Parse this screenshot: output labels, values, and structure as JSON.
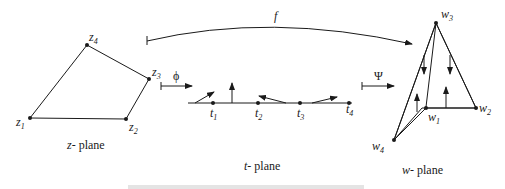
{
  "diagram": {
    "type": "conformal-mapping",
    "planes": {
      "z": {
        "label_var": "z",
        "label_suffix": "- plane",
        "vertices": [
          {
            "name": "z",
            "index": "1"
          },
          {
            "name": "z",
            "index": "2"
          },
          {
            "name": "z",
            "index": "3"
          },
          {
            "name": "z",
            "index": "4"
          }
        ]
      },
      "t": {
        "label_var": "t",
        "label_suffix": "- plane",
        "points": [
          {
            "name": "t",
            "index": "1"
          },
          {
            "name": "t",
            "index": "2"
          },
          {
            "name": "t",
            "index": "3"
          },
          {
            "name": "t",
            "index": "4"
          }
        ]
      },
      "w": {
        "label_var": "w",
        "label_suffix": "- plane",
        "vertices": [
          {
            "name": "w",
            "index": "1"
          },
          {
            "name": "w",
            "index": "2"
          },
          {
            "name": "w",
            "index": "3"
          },
          {
            "name": "w",
            "index": "4"
          }
        ]
      }
    },
    "maps": {
      "phi": "ϕ",
      "psi": "Ψ",
      "f": "f"
    },
    "caption": "",
    "colors": {
      "stroke": "#1a1a1a",
      "background": "#ffffff"
    }
  }
}
